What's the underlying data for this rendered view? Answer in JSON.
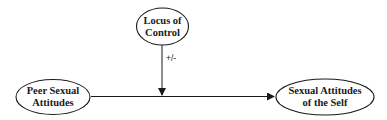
{
  "diagram": {
    "type": "moderation-model",
    "nodes": [
      {
        "id": "locus",
        "lines": [
          "Locus of",
          "Control"
        ],
        "role": "moderator"
      },
      {
        "id": "peer",
        "lines": [
          "Peer Sexual",
          "Attitudes"
        ],
        "role": "predictor"
      },
      {
        "id": "self",
        "lines": [
          "Sexual Attitudes",
          "of the Self"
        ],
        "role": "outcome"
      }
    ],
    "edges": [
      {
        "from": "peer",
        "to": "self",
        "label": ""
      },
      {
        "from": "locus",
        "to": "peer-self-path",
        "label": "+/-"
      }
    ],
    "moderation_label": "+/-"
  }
}
